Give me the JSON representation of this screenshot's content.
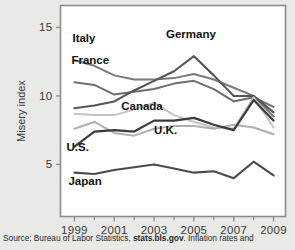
{
  "chart_data": {
    "type": "line",
    "title": "",
    "xlabel": "",
    "ylabel": "Misery index",
    "x": [
      1999,
      2000,
      2001,
      2002,
      2003,
      2004,
      2005,
      2006,
      2007,
      2008,
      2009
    ],
    "xtick_labels": [
      "1999",
      "2001",
      "2003",
      "2005",
      "2007",
      "2009"
    ],
    "xticks": [
      1999,
      2001,
      2003,
      2005,
      2007,
      2009
    ],
    "xlim": [
      1998.3,
      2009.6
    ],
    "ytick_labels": [
      "5",
      "10",
      "15"
    ],
    "yticks": [
      5,
      10,
      15
    ],
    "ylim": [
      1.2,
      16.6
    ],
    "grid": false,
    "legend": "inline-labels",
    "series": [
      {
        "name": "Italy",
        "color": "#7a7a7a",
        "width": 2.0,
        "values": [
          12.6,
          12.2,
          11.5,
          11.2,
          11.2,
          11.3,
          11.6,
          11.2,
          10.6,
          10.0,
          8.5
        ],
        "label": {
          "text": "Italy",
          "x": 1998.9,
          "y": 13.9,
          "anchor": "start"
        }
      },
      {
        "name": "France",
        "color": "#6e6e6e",
        "width": 2.0,
        "values": [
          11.0,
          10.8,
          10.1,
          10.3,
          10.5,
          10.9,
          11.1,
          10.5,
          9.6,
          9.9,
          9.2
        ],
        "label": {
          "text": "France",
          "x": 1998.85,
          "y": 12.3,
          "anchor": "start"
        }
      },
      {
        "name": "Germany",
        "color": "#555555",
        "width": 2.1,
        "values": [
          9.1,
          9.3,
          9.6,
          10.4,
          11.1,
          11.8,
          12.9,
          11.5,
          10.0,
          10.0,
          8.8
        ],
        "label": {
          "text": "Germany",
          "x": 2003.6,
          "y": 14.2,
          "anchor": "start"
        }
      },
      {
        "name": "Canada",
        "color": "#c3c3c3",
        "width": 2.0,
        "values": [
          8.7,
          8.6,
          8.6,
          9.0,
          9.5,
          8.6,
          8.1,
          7.7,
          7.6,
          9.9,
          7.7
        ],
        "label": {
          "text": "Canada",
          "x": 2001.35,
          "y": 8.95,
          "anchor": "start"
        }
      },
      {
        "name": "U.K.",
        "color": "#b0b0b0",
        "width": 2.0,
        "values": [
          7.6,
          8.1,
          7.3,
          7.1,
          7.6,
          7.8,
          7.8,
          7.6,
          7.9,
          7.7,
          7.2
        ],
        "label": {
          "text": "U.K.",
          "x": 2003.0,
          "y": 7.25,
          "anchor": "start"
        }
      },
      {
        "name": "U.S.",
        "color": "#3a3a3a",
        "width": 2.2,
        "values": [
          6.3,
          7.4,
          7.5,
          7.4,
          8.2,
          8.2,
          8.4,
          7.9,
          7.5,
          9.7,
          8.2
        ],
        "label": {
          "text": "U.S.",
          "x": 1998.6,
          "y": 6.0,
          "anchor": "start"
        }
      },
      {
        "name": "Japan",
        "color": "#4a4a4a",
        "width": 2.1,
        "values": [
          4.4,
          4.3,
          4.6,
          4.8,
          5.0,
          4.7,
          4.4,
          4.5,
          4.0,
          5.2,
          4.2
        ],
        "label": {
          "text": "Japan",
          "x": 1998.7,
          "y": 3.5,
          "anchor": "start"
        }
      }
    ]
  },
  "source": {
    "prefix": "Source: Bureau of Labor Statistics, ",
    "link": "stats.bls.gov",
    "suffix": ". Inflation rates and"
  }
}
